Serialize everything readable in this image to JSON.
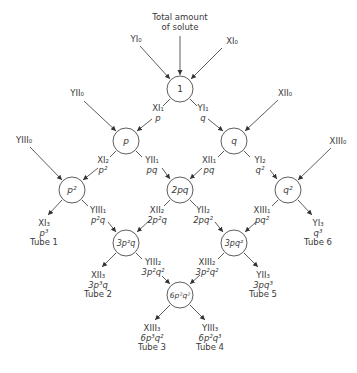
{
  "title": "Total amount of solute",
  "title_lines": [
    "Total amount",
    "of solute"
  ],
  "nodes": [
    {
      "id": "n1",
      "label": "1",
      "x": 180,
      "y": 89
    },
    {
      "id": "np",
      "label": "p",
      "x": 126,
      "y": 141
    },
    {
      "id": "nq",
      "label": "q",
      "x": 234,
      "y": 141
    },
    {
      "id": "np2",
      "label": "p²",
      "x": 72,
      "y": 190
    },
    {
      "id": "n2pq",
      "label": "2pq",
      "x": 180,
      "y": 190
    },
    {
      "id": "nq2",
      "label": "q²",
      "x": 288,
      "y": 190
    },
    {
      "id": "n3p2q",
      "label": "3p²q",
      "x": 126,
      "y": 243
    },
    {
      "id": "n3pq2",
      "label": "3pq²",
      "x": 234,
      "y": 243
    },
    {
      "id": "n6p2q2",
      "label": "6p²q²",
      "x": 180,
      "y": 295
    }
  ],
  "inputs": {
    "YI0": "YI₀",
    "XI0": "XI₀",
    "YII0": "YII₀",
    "XII0": "XII₀",
    "YIII0": "YIII₀",
    "XIII0": "XIII₀"
  },
  "edges": {
    "XI1": {
      "name": "XI₁",
      "expr": "p"
    },
    "YI1": {
      "name": "YI₁",
      "expr": "q"
    },
    "XI2": {
      "name": "XI₂",
      "expr": "p²"
    },
    "YII1": {
      "name": "YII₁",
      "expr": "pq"
    },
    "XII1": {
      "name": "XII₁",
      "expr": "pq"
    },
    "YI2": {
      "name": "YI₂",
      "expr": "q²"
    },
    "YIII1": {
      "name": "YIII₁",
      "expr": "p²q"
    },
    "XII2": {
      "name": "XII₂",
      "expr": "2p²q"
    },
    "YII2": {
      "name": "YII₂",
      "expr": "2pq²"
    },
    "XIII1": {
      "name": "XIII₁",
      "expr": "pq²"
    },
    "YIII2": {
      "name": "YIII₂",
      "expr": "3p²q²"
    },
    "XIII2": {
      "name": "XIII₂",
      "expr": "3p²q²"
    }
  },
  "tubes": [
    {
      "name": "XI₃",
      "expr": "p³",
      "tube": "Tube 1"
    },
    {
      "name": "XII₃",
      "expr": "3p³q",
      "tube": "Tube 2"
    },
    {
      "name": "XIII₃",
      "expr": "6p³q²",
      "tube": "Tube 3"
    },
    {
      "name": "YIII₃",
      "expr": "6p²q³",
      "tube": "Tube 4"
    },
    {
      "name": "YII₃",
      "expr": "3pq³",
      "tube": "Tube 5"
    },
    {
      "name": "YI₃",
      "expr": "q³",
      "tube": "Tube 6"
    }
  ]
}
